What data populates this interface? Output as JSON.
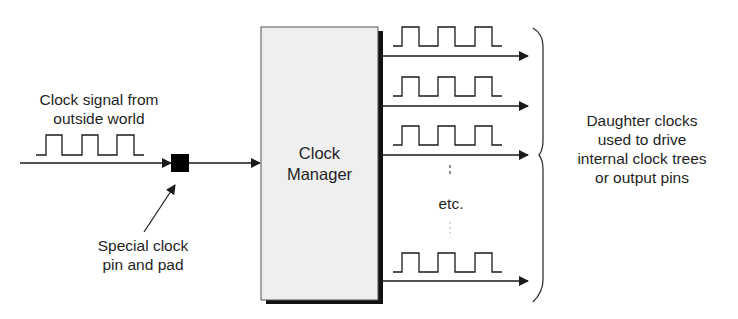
{
  "input": {
    "label_line1": "Clock signal from",
    "label_line2": "outside world"
  },
  "pad": {
    "label_line1": "Special clock",
    "label_line2": "pin and pad"
  },
  "manager": {
    "label_line1": "Clock",
    "label_line2": "Manager"
  },
  "outputs": {
    "etc_label": "etc.",
    "count_visible": 4
  },
  "daughter": {
    "label_line1": "Daughter clocks",
    "label_line2": "used to drive",
    "label_line3": "internal clock trees",
    "label_line4": "or output pins"
  },
  "colors": {
    "line": "#1a1a1a",
    "box_fill": "#efefef",
    "box_shadow": "#111111",
    "pad_fill": "#000000"
  }
}
